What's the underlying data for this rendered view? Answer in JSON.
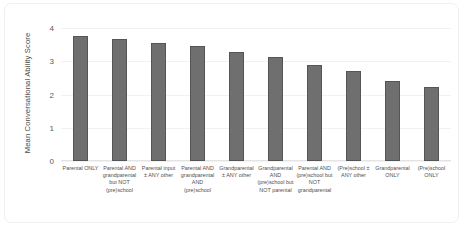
{
  "chart_data": {
    "type": "bar",
    "title": "",
    "xlabel": "",
    "ylabel": "Mean Conversational Ability Score",
    "ylim": [
      0,
      4
    ],
    "yticks": [
      0,
      1,
      2,
      3,
      4
    ],
    "ytick_labels": [
      "0",
      "1",
      "2",
      "3",
      "4"
    ],
    "grid": true,
    "legend": false,
    "categories": [
      "Parental ONLY",
      "Parental AND grandparental but NOT (pre)school",
      "Parental input ± ANY other",
      "Parental AND grandparental AND (pre)school",
      "Grandparental ± ANY other",
      "Grandparental AND (pre)school but NOT parental",
      "Parental AND (pre)school but NOT grandparental",
      "(Pre)school ± ANY other",
      "Grandparental ONLY",
      "(Pre)school ONLY"
    ],
    "values": [
      3.76,
      3.67,
      3.55,
      3.46,
      3.28,
      3.13,
      2.89,
      2.71,
      2.41,
      2.23
    ],
    "bar_color": "#6f6f6f",
    "bar_edge_color": "#555555",
    "gridline_color": "#f2f2f2",
    "background_color": "#ffffff"
  }
}
